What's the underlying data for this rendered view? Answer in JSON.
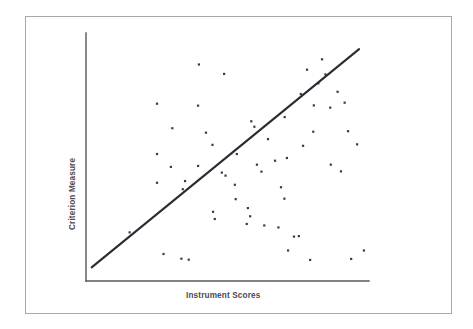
{
  "figure": {
    "kind": "scatter-plot-with-regression-line",
    "background_color": "#ffffff",
    "border_color": "#a8a8a8",
    "point_color": "#3a3a44",
    "line_color": "#2b2b33",
    "axis_color": "#58585a"
  },
  "axes": {
    "x_title": "Instrument Scores",
    "y_title": "Criterion Measure"
  },
  "chart_data": {
    "type": "scatter",
    "title": "",
    "xlabel": "Instrument Scores",
    "ylabel": "Criterion Measure",
    "xlim": [
      0,
      100
    ],
    "ylim": [
      0,
      100
    ],
    "grid": false,
    "legend": null,
    "tick_labels": {
      "x": [],
      "y": []
    },
    "points": [
      [
        15.4,
        19.6
      ],
      [
        25.1,
        71.5
      ],
      [
        25.1,
        51.2
      ],
      [
        25.1,
        39.6
      ],
      [
        27.4,
        10.9
      ],
      [
        30.5,
        61.6
      ],
      [
        33.7,
        9.0
      ],
      [
        36.3,
        8.6
      ],
      [
        39.6,
        70.7
      ],
      [
        39.6,
        46.4
      ],
      [
        35.0,
        40.3
      ],
      [
        34.2,
        37.0
      ],
      [
        39.9,
        87.3
      ],
      [
        44.7,
        54.9
      ],
      [
        48.8,
        83.5
      ],
      [
        44.9,
        27.9
      ],
      [
        45.5,
        25.0
      ],
      [
        48.0,
        43.7
      ],
      [
        49.3,
        42.5
      ],
      [
        52.6,
        38.8
      ],
      [
        53.3,
        51.2
      ],
      [
        56.8,
        23.0
      ],
      [
        58.4,
        64.4
      ],
      [
        59.5,
        62.2
      ],
      [
        52.9,
        33.0
      ],
      [
        68.9,
        37.8
      ],
      [
        63.0,
        22.4
      ],
      [
        68.0,
        21.6
      ],
      [
        70.1,
        33.2
      ],
      [
        73.5,
        17.9
      ],
      [
        71.4,
        12.3
      ],
      [
        75.2,
        18.1
      ],
      [
        64.3,
        57.2
      ],
      [
        70.2,
        66.1
      ],
      [
        71.0,
        49.6
      ],
      [
        76.7,
        54.5
      ],
      [
        80.3,
        60.2
      ],
      [
        80.5,
        70.8
      ],
      [
        75.9,
        75.4
      ],
      [
        82.1,
        79.7
      ],
      [
        84.6,
        83.3
      ],
      [
        86.3,
        69.9
      ],
      [
        78.1,
        85.2
      ],
      [
        83.4,
        89.4
      ],
      [
        88.9,
        76.3
      ],
      [
        91.4,
        71.9
      ],
      [
        86.5,
        46.9
      ],
      [
        90.1,
        44.2
      ],
      [
        92.6,
        60.4
      ],
      [
        95.8,
        55.1
      ],
      [
        79.2,
        8.5
      ],
      [
        93.7,
        8.9
      ],
      [
        98.2,
        12.3
      ],
      [
        30.0,
        46.0
      ],
      [
        42.4,
        59.8
      ],
      [
        60.4,
        46.9
      ],
      [
        62.0,
        44.1
      ],
      [
        66.8,
        48.5
      ],
      [
        57.2,
        29.4
      ],
      [
        58.0,
        26.1
      ]
    ],
    "fit_line": {
      "x_start": 2.0,
      "y_start": 5.5,
      "x_end": 96.5,
      "y_end": 93.5
    }
  }
}
